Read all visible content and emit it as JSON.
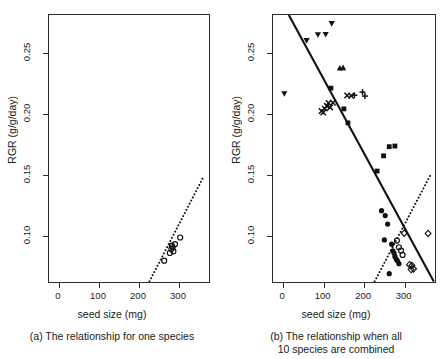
{
  "figure": {
    "panels": [
      {
        "id": "a",
        "caption_line1": "(a) The relationship for one species",
        "caption_line2": ""
      },
      {
        "id": "b",
        "caption_line1": "(b) The relationship when all",
        "caption_line2": "10 species are combined"
      }
    ]
  },
  "axes": {
    "xlabel": "seed size (mg)",
    "ylabel": "RGR (g/g/day)",
    "xticks": [
      "0",
      "100",
      "200",
      "300"
    ],
    "yticks": [
      "0.10",
      "0.15",
      "0.20",
      "0.25"
    ]
  },
  "chart_data": {
    "type": "scatter",
    "title": "",
    "xlabel": "seed size (mg)",
    "ylabel": "RGR (g/g/day)",
    "xlim": [
      -25,
      375
    ],
    "ylim": [
      0.062,
      0.281
    ],
    "xticks": [
      0,
      100,
      200,
      300
    ],
    "yticks": [
      0.1,
      0.15,
      0.2,
      0.25
    ],
    "grid": false,
    "legend": "none",
    "panels": [
      {
        "id": "a",
        "caption": "(a) The relationship for one species",
        "series": [
          {
            "name": "one species",
            "marker": "open-circle",
            "points": [
              [
                263,
                0.0795
              ],
              [
                277,
                0.0858
              ],
              [
                281,
                0.089
              ],
              [
                282,
                0.0918
              ],
              [
                284,
                0.0905
              ],
              [
                286,
                0.0872
              ],
              [
                290,
                0.093
              ],
              [
                303,
                0.0985
              ]
            ]
          }
        ],
        "fits": [
          {
            "name": "within-species regression",
            "style": "dotted",
            "slope_positive": true,
            "endpoints": [
              [
                226,
                0.0625
              ],
              [
                360,
                0.1475
              ]
            ]
          }
        ]
      },
      {
        "id": "b",
        "caption": "(b) The relationship when all 10 species are combined",
        "series": [
          {
            "name": "species-1",
            "marker": "filled-triangle-down",
            "points": [
              [
                3,
                0.2165
              ],
              [
                58,
                0.26
              ],
              [
                86,
                0.2648
              ],
              [
                105,
                0.265
              ],
              [
                120,
                0.274
              ]
            ]
          },
          {
            "name": "species-2",
            "marker": "filled-triangle-up",
            "points": [
              [
                140,
                0.2375
              ],
              [
                148,
                0.2378
              ]
            ]
          },
          {
            "name": "species-3",
            "marker": "cross-x",
            "points": [
              [
                95,
                0.2022
              ],
              [
                99,
                0.201
              ],
              [
                103,
                0.2042
              ],
              [
                108,
                0.2065
              ],
              [
                112,
                0.2088
              ],
              [
                116,
                0.2052
              ],
              [
                123,
                0.209
              ],
              [
                158,
                0.215
              ],
              [
                168,
                0.2148
              ]
            ]
          },
          {
            "name": "species-4",
            "marker": "plus",
            "points": [
              [
                176,
                0.2152
              ],
              [
                196,
                0.2178
              ],
              [
                202,
                0.2145
              ]
            ]
          },
          {
            "name": "species-5",
            "marker": "filled-square",
            "points": [
              [
                118,
                0.221
              ],
              [
                150,
                0.204
              ],
              [
                160,
                0.1925
              ],
              [
                232,
                0.153
              ],
              [
                248,
                0.1655
              ],
              [
                262,
                0.173
              ],
              [
                276,
                0.1735
              ]
            ]
          },
          {
            "name": "species-6",
            "marker": "filled-circle",
            "points": [
              [
                243,
                0.1205
              ],
              [
                252,
                0.1165
              ],
              [
                258,
                0.1095
              ],
              [
                250,
                0.0965
              ],
              [
                268,
                0.093
              ],
              [
                271,
                0.0875
              ],
              [
                274,
                0.0858
              ],
              [
                276,
                0.083
              ],
              [
                279,
                0.0808
              ],
              [
                282,
                0.0795
              ],
              [
                286,
                0.077
              ],
              [
                262,
                0.0688
              ]
            ]
          },
          {
            "name": "species-7",
            "marker": "open-circle",
            "points": [
              [
                281,
                0.096
              ],
              [
                286,
                0.0905
              ],
              [
                291,
                0.0878
              ],
              [
                295,
                0.0842
              ]
            ]
          },
          {
            "name": "species-8",
            "marker": "open-diamond",
            "points": [
              [
                299,
                0.102
              ],
              [
                358,
                0.1018
              ],
              [
                312,
                0.0762
              ],
              [
                318,
                0.0755
              ],
              [
                316,
                0.0722
              ],
              [
                322,
                0.0728
              ]
            ]
          }
        ],
        "fits": [
          {
            "name": "across-species regression",
            "style": "solid",
            "slope_positive": false,
            "endpoints": [
              [
                14,
                0.281
              ],
              [
                372,
                0.0625
              ]
            ]
          },
          {
            "name": "within-species regression",
            "style": "dotted",
            "slope_positive": true,
            "endpoints": [
              [
                226,
                0.0625
              ],
              [
                366,
                0.1512
              ]
            ]
          }
        ]
      }
    ]
  }
}
